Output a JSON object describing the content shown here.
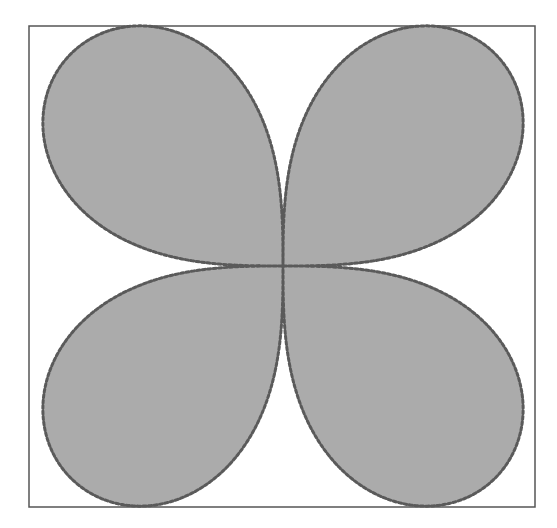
{
  "figure": {
    "type": "polar-rose",
    "petal_count": 4,
    "frame": {
      "x": 29,
      "y": 26,
      "width": 506,
      "height": 481,
      "stroke": "#555555"
    },
    "center": {
      "x": 283,
      "y": 266
    },
    "radius": 300,
    "exponent": 0.55,
    "colors": {
      "fill": "#ababab",
      "outline_dots": "#5a5a5a",
      "background": "#ffffff"
    }
  }
}
